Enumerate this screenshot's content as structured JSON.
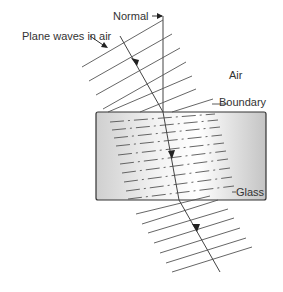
{
  "diagram": {
    "labels": {
      "normal": "Normal",
      "plane_waves": "Plane waves in air",
      "air": "Air",
      "boundary": "Boundary",
      "glass": "Glass"
    },
    "colors": {
      "line": "#444444",
      "glass_light": "#f4f4f4",
      "glass_dark": "#bdbdbd",
      "glass_border": "#333333"
    }
  }
}
